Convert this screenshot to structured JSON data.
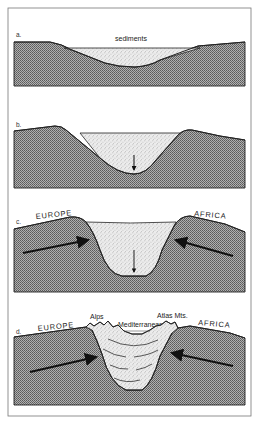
{
  "figure": {
    "panels": [
      {
        "id": "a",
        "label": "a.",
        "annotations": [
          "sediments"
        ]
      },
      {
        "id": "b",
        "label": "b.",
        "annotations": [],
        "arrows": [
          "subsidence-down"
        ]
      },
      {
        "id": "c",
        "label": "c.",
        "annotations": [
          "EUROPE",
          "AFRICA"
        ],
        "arrows": [
          "subsidence-down",
          "europe-push-right",
          "africa-push-left"
        ]
      },
      {
        "id": "d",
        "label": "d.",
        "annotations": [
          "EUROPE",
          "Alps",
          "Mediterranean",
          "Atlas Mts.",
          "AFRICA"
        ],
        "arrows": [
          "europe-push-right",
          "africa-push-left"
        ]
      }
    ],
    "colors": {
      "rock": "#9a9a9a",
      "sediment": "#e6e6e6",
      "outline": "#222222",
      "frame": "#777777"
    }
  }
}
